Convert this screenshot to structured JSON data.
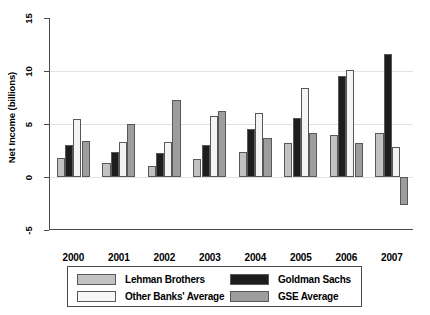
{
  "chart_data": {
    "type": "bar",
    "title": "",
    "subtitle": "",
    "xlabel": "",
    "ylabel": "Net Income (billions)",
    "categories": [
      "2000",
      "2001",
      "2002",
      "2003",
      "2004",
      "2005",
      "2006",
      "2007"
    ],
    "series": [
      {
        "name": "Lehman Brothers",
        "color": "#c2c2c2",
        "values": [
          1.8,
          1.3,
          1.0,
          1.7,
          2.4,
          3.2,
          4.0,
          4.2
        ]
      },
      {
        "name": "Goldman Sachs",
        "color": "#1d1d1d",
        "values": [
          3.0,
          2.4,
          2.3,
          3.0,
          4.5,
          5.6,
          9.5,
          11.6
        ]
      },
      {
        "name": "Other Banks' Average",
        "color": "#f4f4f2",
        "values": [
          5.5,
          3.3,
          3.3,
          5.8,
          6.0,
          8.4,
          10.1,
          2.8
        ]
      },
      {
        "name": "GSE Average",
        "color": "#9d9d9d",
        "values": [
          3.4,
          5.0,
          7.3,
          6.2,
          3.7,
          4.2,
          3.2,
          -2.6
        ]
      }
    ],
    "ylim": [
      -5,
      15
    ],
    "yticks": [
      -5,
      0,
      5,
      10,
      15
    ],
    "ytick_labels": [
      "-5",
      "0",
      "5",
      "10",
      "15"
    ],
    "gridlines": [
      0,
      5,
      10
    ],
    "grid": true,
    "legend_position": "bottom",
    "legend_entries": [
      {
        "label": "Lehman Brothers",
        "series": 0
      },
      {
        "label": "Goldman Sachs",
        "series": 1
      },
      {
        "label": "Other Banks' Average",
        "series": 2
      },
      {
        "label": "GSE Average",
        "series": 3
      }
    ]
  }
}
